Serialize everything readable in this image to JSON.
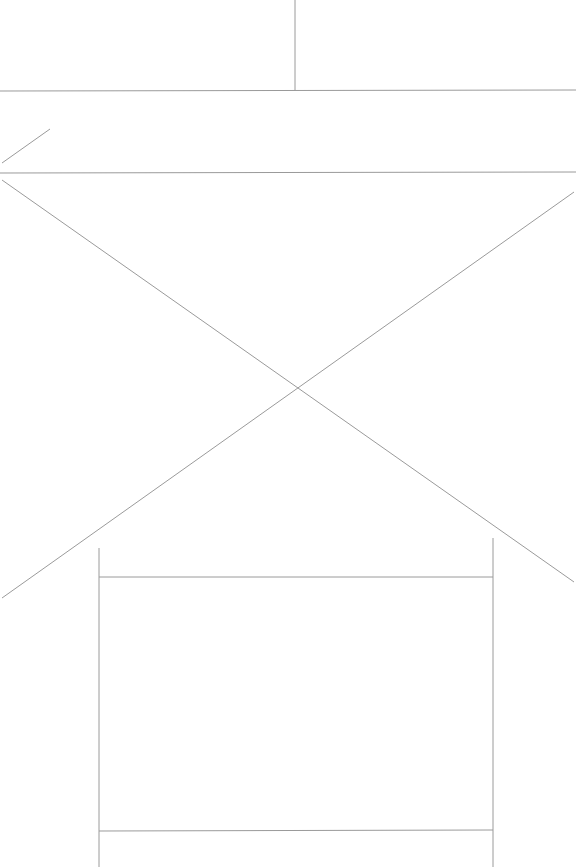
{
  "wireframe": {
    "line_color": "#9a9a9a",
    "background": "#ffffff",
    "regions": [
      {
        "name": "header-left-panel"
      },
      {
        "name": "header-right-panel"
      },
      {
        "name": "navigation-bar"
      },
      {
        "name": "image-placeholder"
      },
      {
        "name": "content-card"
      }
    ]
  }
}
